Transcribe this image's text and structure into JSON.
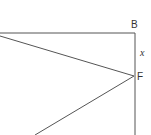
{
  "diagram": {
    "type": "geometry",
    "stroke_color": "#555555",
    "points": {
      "B": {
        "label": "B",
        "x": 135,
        "y": 33
      },
      "F": {
        "label": "F",
        "x": 135,
        "y": 76
      }
    },
    "segment_labels": {
      "BF": {
        "label": "x"
      }
    },
    "segments": [
      {
        "from": "left-edge-top",
        "to": "B",
        "desc": "top side"
      },
      {
        "from": "B",
        "to": "bottom",
        "desc": "right side through F"
      },
      {
        "from": "left-edge",
        "to": "F",
        "desc": "diagonal to F"
      },
      {
        "from": "F",
        "to": "bottom-left",
        "desc": "diagonal from F"
      }
    ]
  }
}
